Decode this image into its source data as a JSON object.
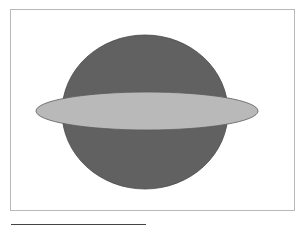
{
  "header": {
    "cutoff_text": "· · ·"
  },
  "figure": {
    "frame_color": "#b8b8b8",
    "sphere": {
      "shape": "circle",
      "cx": 145,
      "cy": 112,
      "rx": 83,
      "ry": 77,
      "fill": "#616161",
      "stroke": "#4a4a4a"
    },
    "ring": {
      "shape": "ellipse",
      "cx": 147,
      "cy": 111,
      "rx": 111,
      "ry": 19,
      "fill": "#b9b9b9",
      "stroke": "#5a5a5a"
    }
  },
  "footnote": {
    "rule_color": "#444444"
  }
}
